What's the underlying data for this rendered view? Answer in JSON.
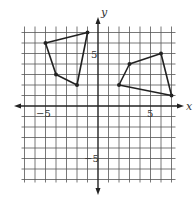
{
  "chart_data": {
    "type": "scatter",
    "title": "",
    "xlabel": "x",
    "ylabel": "y",
    "xlim": [
      -7,
      7
    ],
    "ylim": [
      -7,
      7
    ],
    "grid": true,
    "tick_labels": {
      "x": [
        {
          "value": -5,
          "label": "−5"
        },
        {
          "value": 5,
          "label": "5"
        }
      ],
      "y": [
        {
          "value": 5,
          "label": "5"
        },
        {
          "value": -5,
          "label": "−5"
        }
      ]
    },
    "series": [
      {
        "name": "quadrilateral-left",
        "closed": true,
        "points": [
          [
            -5,
            6
          ],
          [
            -1,
            7
          ],
          [
            -2,
            2
          ],
          [
            -4,
            3
          ]
        ]
      },
      {
        "name": "quadrilateral-right",
        "closed": true,
        "points": [
          [
            3,
            4
          ],
          [
            6,
            5
          ],
          [
            7,
            1
          ],
          [
            2,
            2
          ]
        ]
      }
    ]
  },
  "axes": {
    "x_name": "x",
    "y_name": "y",
    "x_tick_neg": "−5",
    "x_tick_pos": "5",
    "y_tick_pos": "5",
    "y_tick_neg": "−5"
  },
  "colors": {
    "grid": "#555555",
    "axis": "#222222",
    "shape": "#222222"
  }
}
